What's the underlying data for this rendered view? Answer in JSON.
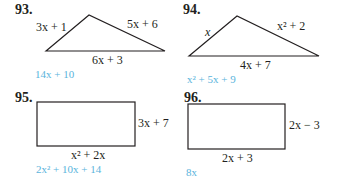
{
  "problems": [
    {
      "number": "93.",
      "shape": "triangle",
      "sides": {
        "left": "3x + 1",
        "right": "5x + 6",
        "bottom": "6x + 3"
      },
      "answer": "14x + 10"
    },
    {
      "number": "94.",
      "shape": "triangle",
      "sides": {
        "left": "x",
        "right": "x² + 2",
        "bottom": "4x + 7"
      },
      "answer": "x² + 5x + 9"
    },
    {
      "number": "95.",
      "shape": "rectangle",
      "sides": {
        "right": "3x + 7",
        "bottom": "x² + 2x"
      },
      "answer": "2x² + 10x + 14"
    },
    {
      "number": "96.",
      "shape": "rectangle",
      "sides": {
        "right": "2x − 3",
        "bottom": "2x + 3"
      },
      "answer": "8x"
    }
  ],
  "colors": {
    "text": "#231f20",
    "answer": "#5ab4dc",
    "line": "#231f20"
  }
}
